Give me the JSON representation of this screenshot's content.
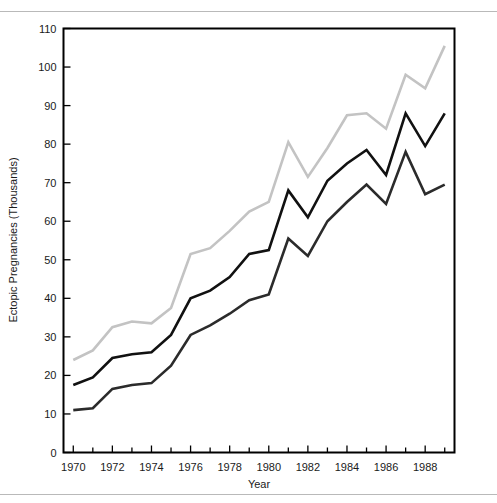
{
  "figure": {
    "background_color": "#ffffff",
    "rule_color": "#b9b9b9",
    "ghost_caption": ""
  },
  "chart_data": {
    "type": "line",
    "title": "",
    "xlabel": "Year",
    "ylabel": "Ectopic Pregnancies (Thousands)",
    "xlim": [
      1969.5,
      1989.5
    ],
    "ylim": [
      0,
      110
    ],
    "grid": false,
    "legend": "none",
    "x_tick_labels": [
      "1970",
      "1972",
      "1974",
      "1976",
      "1978",
      "1980",
      "1982",
      "1984",
      "1986",
      "1988"
    ],
    "x_tick_values": [
      1970,
      1972,
      1974,
      1976,
      1978,
      1980,
      1982,
      1984,
      1986,
      1988
    ],
    "x_minor_ticks": [
      1971,
      1973,
      1975,
      1977,
      1979,
      1981,
      1983,
      1985,
      1987,
      1989
    ],
    "y_tick_labels": [
      "0",
      "10",
      "20",
      "30",
      "40",
      "50",
      "60",
      "70",
      "80",
      "90",
      "100",
      "110"
    ],
    "y_tick_values": [
      0,
      10,
      20,
      30,
      40,
      50,
      60,
      70,
      80,
      90,
      100,
      110
    ],
    "x": [
      1970,
      1971,
      1972,
      1973,
      1974,
      1975,
      1976,
      1977,
      1978,
      1979,
      1980,
      1981,
      1982,
      1983,
      1984,
      1985,
      1986,
      1987,
      1988,
      1989
    ],
    "series": [
      {
        "name": "upper",
        "color": "#c3c3c3",
        "width": 2.6,
        "values": [
          24,
          26.5,
          32.5,
          34,
          33.5,
          37.5,
          51.5,
          53,
          57.5,
          62.5,
          65,
          80.5,
          71.5,
          79,
          87.5,
          88,
          84,
          98,
          94.5,
          105.5
        ]
      },
      {
        "name": "point-estimate",
        "color": "#111111",
        "width": 2.6,
        "values": [
          17.5,
          19.5,
          24.5,
          25.5,
          26,
          30.5,
          40,
          42,
          45.5,
          51.5,
          52.5,
          68,
          61,
          70.5,
          75,
          78.5,
          72,
          88,
          79.5,
          88
        ]
      },
      {
        "name": "lower",
        "color": "#2b2b2b",
        "width": 2.6,
        "values": [
          11,
          11.5,
          16.5,
          17.5,
          18,
          22.5,
          30.5,
          33,
          36,
          39.5,
          41,
          55.5,
          51,
          60,
          65,
          69.5,
          64.5,
          78,
          67,
          69.5
        ]
      }
    ]
  }
}
